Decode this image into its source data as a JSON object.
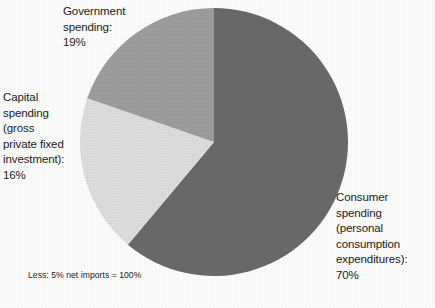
{
  "figure": {
    "background_color": "#fefefe",
    "text_color": "#1c1c1c"
  },
  "labels": {
    "government": "Government\nspending:\n19%",
    "capital": "Capital\nspending\n(gross\nprivate fixed\ninvestment):\n16%",
    "consumer": "Consumer\nspending\n(personal\nconsumption\nexpenditures):\n70%"
  },
  "footnote": "Less: 5% net imports = 100%",
  "chart_data": {
    "type": "pie",
    "title": "",
    "subtitle": "",
    "xlabel": "",
    "ylabel": "",
    "legend_position": "none",
    "grid": false,
    "note": "Less: 5% net imports = 100%",
    "start_angle_deg": 0,
    "direction": "clockwise",
    "categories": [
      "Consumer spending (personal consumption expenditures)",
      "Capital spending (gross private fixed investment)",
      "Government spending"
    ],
    "values": [
      70,
      16,
      19
    ],
    "value_labels": [
      "70%",
      "16%",
      "19%"
    ],
    "colors": [
      "#6a6a6a",
      "#dedede",
      "#9e9e9e"
    ],
    "slices": [
      {
        "name": "Consumer spending (personal consumption expenditures)",
        "value": 70,
        "label": "70%",
        "color": "#6a6a6a",
        "start_angle_deg": 0,
        "end_angle_deg": 220
      },
      {
        "name": "Capital spending (gross private fixed investment)",
        "value": 16,
        "label": "16%",
        "color": "#dedede",
        "start_angle_deg": 220,
        "end_angle_deg": 289
      },
      {
        "name": "Government spending",
        "value": 19,
        "label": "19%",
        "color": "#9e9e9e",
        "start_angle_deg": 289,
        "end_angle_deg": 360
      }
    ],
    "total_shown_percent": 105,
    "net_imports_percent": 5,
    "normalized_total_percent": 100
  }
}
